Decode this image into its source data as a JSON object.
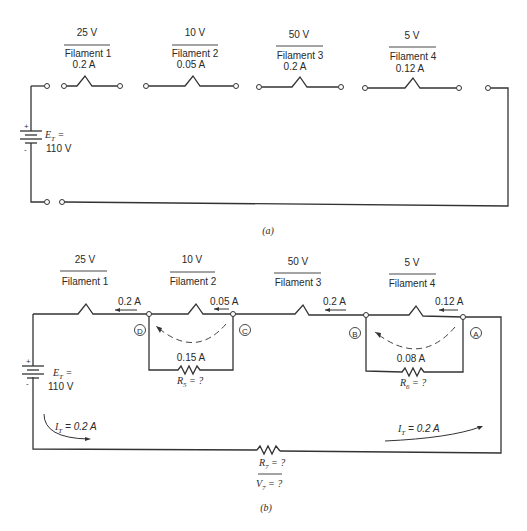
{
  "part_a": {
    "caption": "(a)",
    "source": {
      "label_prefix": "E",
      "label_sub": "T",
      "label_eq": " =",
      "value": "110 V",
      "plus": "+",
      "minus": "-"
    },
    "filaments": [
      {
        "voltage": "25 V",
        "name": "Filament 1",
        "current": "0.2 A"
      },
      {
        "voltage": "10 V",
        "name": "Filament 2",
        "current": "0.05 A"
      },
      {
        "voltage": "50 V",
        "name": "Filament 3",
        "current": "0.2 A"
      },
      {
        "voltage": "5 V",
        "name": "Filament 4",
        "current": "0.12 A"
      }
    ]
  },
  "part_b": {
    "caption": "(b)",
    "source": {
      "label_prefix": "E",
      "label_sub": "T",
      "label_eq": " =",
      "value": "110 V",
      "plus": "+",
      "minus": "-"
    },
    "filaments": [
      {
        "voltage": "25 V",
        "name": "Filament 1"
      },
      {
        "voltage": "10 V",
        "name": "Filament 2"
      },
      {
        "voltage": "50 V",
        "name": "Filament 3"
      },
      {
        "voltage": "5 V",
        "name": "Filament 4"
      }
    ],
    "branch_currents": {
      "left_of_D": "0.2 A",
      "filament2": "0.05 A",
      "left_of_B": "0.2 A",
      "filament4": "0.12 A"
    },
    "nodes": {
      "A": "A",
      "B": "B",
      "C": "C",
      "D": "D"
    },
    "shunt_R5": {
      "current": "0.15 A",
      "label_prefix": "R",
      "label_sub": "5",
      "label_value": " = ?"
    },
    "shunt_R6": {
      "current": "0.08 A",
      "label_prefix": "R",
      "label_sub": "6",
      "label_value": " = ?"
    },
    "series_R7": {
      "r_prefix": "R",
      "r_sub": "7",
      "r_value": " = ?",
      "v_prefix": "V",
      "v_sub": "7",
      "v_value": " = ?"
    },
    "total_current_left": {
      "prefix": "I",
      "sub": "T",
      "value": " = 0.2 A"
    },
    "total_current_right": {
      "prefix": "I",
      "sub": "T",
      "value": " = 0.2 A"
    }
  }
}
